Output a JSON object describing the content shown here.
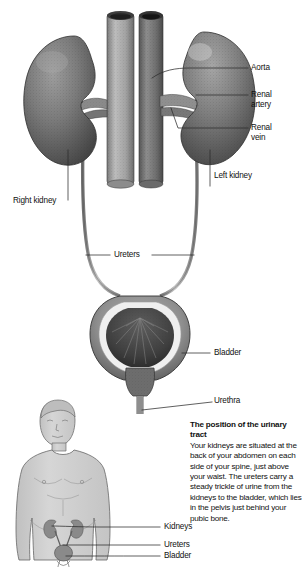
{
  "figure": {
    "title_alt": "Urinary tract anatomy diagram",
    "colors": {
      "ink": "#111111",
      "background": "#ffffff",
      "kidney_dark": "#5d5d5d",
      "kidney_mid": "#8a8a8a",
      "vena_cava": "#a9a9a9",
      "aorta": "#6f6f6f",
      "bladder_wall": "#9a9a9a",
      "bladder_interior": "#4a4a4a",
      "body_fill": "#cfcfcf",
      "body_outline": "#6e6e6e",
      "organ_highlight": "#8d8d8d",
      "leader_line": "#2b2b2b"
    }
  },
  "labels": {
    "aorta": "Aorta",
    "renal_artery_line1": "Renal",
    "renal_artery_line2": "artery",
    "renal_vein_line1": "Renal",
    "renal_vein_line2": "vein",
    "left_kidney": "Left kidney",
    "right_kidney": "Right kidney",
    "ureters": "Ureters",
    "bladder": "Bladder",
    "urethra": "Urethra",
    "body_kidneys": "Kidneys",
    "body_ureters": "Ureters",
    "body_bladder": "Bladder"
  },
  "caption": {
    "title": "The position of the uri­nary tract",
    "body": "Your kidneys are situated at the back of your abdo­men on each side of your spine, just above your waist. The ureters carry a steady trickle of urine from the kidneys to the bladder, which lies in the pelvis just behind your pubic bone."
  }
}
